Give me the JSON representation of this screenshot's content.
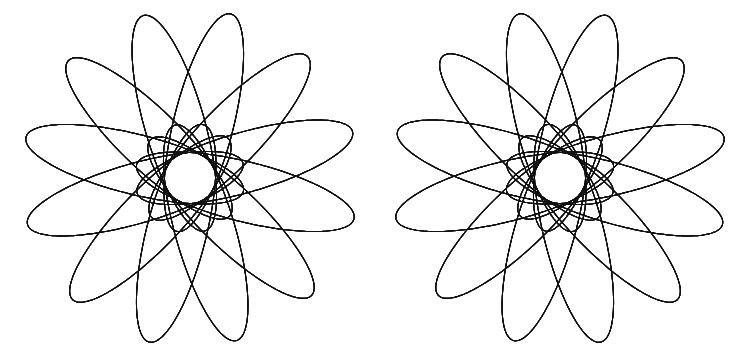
{
  "page": {
    "background_color": "#ffffff",
    "width": 740,
    "height": 363
  },
  "artwork": {
    "name": "mirrored-spirograph-pair",
    "description": "Two mirror-image five-petal spirograph rosettes drawn as families of rotating ellipses in black line on white.",
    "stroke_color": "#111111",
    "stroke_width": 1,
    "fill": "none",
    "figure_count": 2,
    "symmetry": "horizontal-mirror"
  },
  "chart_data": {
    "type": "line",
    "subtitle": "",
    "xlabel": "",
    "ylabel": "",
    "grid": false,
    "legend": "none",
    "xlim": [
      0,
      740
    ],
    "ylim": [
      0,
      363
    ],
    "curve_family": "rotating-ellipse rose (hypotrochoid-like)",
    "series": [
      {
        "name": "left-rosette",
        "center": [
          190,
          178
        ],
        "petals": 5,
        "ellipses_per_figure": 60,
        "ellipse_semi_major": 112,
        "ellipse_semi_minor": 30,
        "offset_from_center": 55,
        "rotation_step_deg": 6,
        "base_rotation_deg": 14,
        "petal_angles_deg": [
          76,
          4,
          -68,
          -140,
          148
        ],
        "handedness": "right",
        "bbox": [
          48,
          25,
          353,
          336
        ]
      },
      {
        "name": "right-rosette",
        "center": [
          560,
          178
        ],
        "petals": 5,
        "ellipses_per_figure": 60,
        "ellipse_semi_major": 112,
        "ellipse_semi_minor": 30,
        "offset_from_center": 55,
        "rotation_step_deg": 6,
        "base_rotation_deg": 14,
        "petal_angles_deg": [
          104,
          176,
          248,
          320,
          32
        ],
        "handedness": "left",
        "bbox": [
          397,
          25,
          702,
          336
        ]
      }
    ]
  }
}
